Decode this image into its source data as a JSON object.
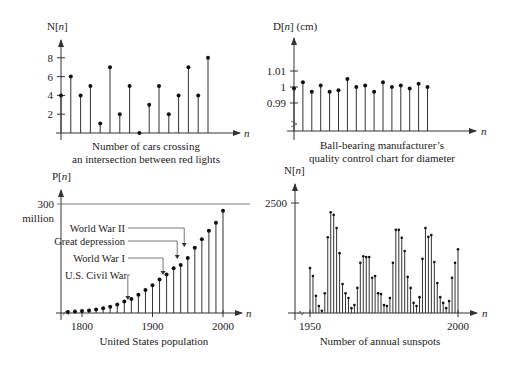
{
  "chart_data": [
    {
      "id": "cars",
      "type": "stem",
      "title": "Number of cars crossing an intersection between red lights",
      "caption_lines": [
        "Number of cars crossing",
        "an intersection between red lights"
      ],
      "ylabel": "N[n]",
      "xlabel": "n",
      "yticks": [
        2,
        4,
        6,
        8
      ],
      "ylim": [
        0,
        9
      ],
      "x": [
        0,
        1,
        2,
        3,
        4,
        5,
        6,
        7,
        8,
        9,
        10,
        11,
        12,
        13,
        14,
        15
      ],
      "values": [
        4,
        6,
        4,
        5,
        1,
        7,
        2,
        5,
        0,
        3,
        5,
        2,
        4,
        7,
        4,
        8
      ]
    },
    {
      "id": "ballbearing",
      "type": "stem",
      "title": "Ball-bearing manufacturer's quality control chart for diameter",
      "caption_lines": [
        "Ball-bearing manufacturer’s",
        "quality control chart for diameter"
      ],
      "ylabel": "D[n] (cm)",
      "xlabel": "n",
      "yticks": [
        0.99,
        1,
        1.01
      ],
      "ytick_labels": [
        "0.99",
        "1",
        "1.01"
      ],
      "axis_break": true,
      "x": [
        0,
        1,
        2,
        3,
        4,
        5,
        6,
        7,
        8,
        9,
        10,
        11,
        12,
        13,
        14,
        15
      ],
      "values": [
        0.999,
        1.003,
        0.997,
        1.001,
        0.997,
        0.998,
        1.005,
        1.0,
        1.001,
        0.997,
        1.003,
        1.0,
        1.001,
        0.999,
        1.002,
        1.0
      ]
    },
    {
      "id": "population",
      "type": "stem",
      "title": "United States population",
      "caption_lines": [
        "United States population"
      ],
      "ylabel": "P[n]",
      "xlabel": "n",
      "ytick_label": "300",
      "ytick_sublabel": "million",
      "ytick_value": 300,
      "xticks": [
        1800,
        1900,
        2000
      ],
      "x": [
        1780,
        1790,
        1800,
        1810,
        1820,
        1830,
        1840,
        1850,
        1860,
        1870,
        1880,
        1890,
        1900,
        1910,
        1920,
        1930,
        1940,
        1950,
        1960,
        1970,
        1980,
        1990,
        2000
      ],
      "values": [
        2.8,
        3.9,
        5.3,
        7.2,
        9.6,
        12.9,
        17.1,
        23.2,
        31.4,
        38.6,
        50.2,
        63.0,
        76.2,
        92.2,
        106.0,
        123.2,
        132.2,
        151.3,
        179.3,
        203.3,
        226.5,
        248.7,
        281.4
      ],
      "annotations": [
        {
          "label": "World War II",
          "year": 1945
        },
        {
          "label": "Great depression",
          "year": 1935
        },
        {
          "label": "World War I",
          "year": 1915
        },
        {
          "label": "U.S. Civil War",
          "year": 1865
        }
      ]
    },
    {
      "id": "sunspots",
      "type": "stem",
      "title": "Number of annual sunspots",
      "caption_lines": [
        "Number of annual sunspots"
      ],
      "ylabel": "N[n]",
      "xlabel": "n",
      "ytick_label": "2500",
      "ytick_value": 2500,
      "xticks": [
        1950,
        2000
      ],
      "axis_break": true,
      "x": [
        1950,
        1951,
        1952,
        1953,
        1954,
        1955,
        1956,
        1957,
        1958,
        1959,
        1960,
        1961,
        1962,
        1963,
        1964,
        1965,
        1966,
        1967,
        1968,
        1969,
        1970,
        1971,
        1972,
        1973,
        1974,
        1975,
        1976,
        1977,
        1978,
        1979,
        1980,
        1981,
        1982,
        1983,
        1984,
        1985,
        1986,
        1987,
        1988,
        1989,
        1990,
        1991,
        1992,
        1993,
        1994,
        1995,
        1996,
        1997,
        1998,
        1999,
        2000
      ],
      "values": [
        1020,
        840,
        390,
        160,
        50,
        450,
        1720,
        2290,
        2230,
        1930,
        1360,
        660,
        450,
        340,
        110,
        180,
        570,
        1140,
        1290,
        1270,
        1270,
        800,
        840,
        450,
        430,
        180,
        160,
        340,
        1140,
        1890,
        1890,
        1710,
        1410,
        820,
        570,
        230,
        160,
        360,
        1230,
        1930,
        1730,
        1770,
        1160,
        680,
        360,
        230,
        110,
        270,
        800,
        1140,
        1450
      ]
    }
  ]
}
